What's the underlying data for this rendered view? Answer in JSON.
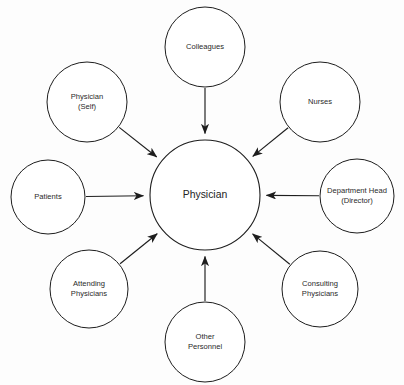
{
  "diagram": {
    "type": "hub-and-spoke",
    "background_color": "#fdfdfd",
    "line_color": "#1d1d1d",
    "text_color": "#2a2a2a",
    "center": {
      "id": "physician",
      "label": "Physician",
      "cx": 205,
      "cy": 195,
      "r": 55
    },
    "nodes": [
      {
        "id": "colleagues",
        "lines": [
          "Colleagues"
        ],
        "cx": 205,
        "cy": 47,
        "r": 40,
        "arrow_direction": "inward"
      },
      {
        "id": "physician-self",
        "lines": [
          "Physician",
          "(Self)"
        ],
        "cx": 87,
        "cy": 102,
        "r": 40,
        "arrow_direction": "inward"
      },
      {
        "id": "nurses",
        "lines": [
          "Nurses"
        ],
        "cx": 320,
        "cy": 102,
        "r": 40,
        "arrow_direction": "inward"
      },
      {
        "id": "department-head",
        "lines": [
          "Department Head",
          "(Director)"
        ],
        "cx": 357,
        "cy": 196,
        "r": 37,
        "arrow_direction": "inward"
      },
      {
        "id": "patients",
        "lines": [
          "Patients"
        ],
        "cx": 48,
        "cy": 197,
        "r": 37,
        "arrow_direction": "inward"
      },
      {
        "id": "attending-physicians",
        "lines": [
          "Attending",
          "Physicians"
        ],
        "cx": 89,
        "cy": 289,
        "r": 39,
        "arrow_direction": "inward"
      },
      {
        "id": "other-personnel",
        "lines": [
          "Other",
          "Personnel"
        ],
        "cx": 205,
        "cy": 342,
        "r": 40,
        "arrow_direction": "inward"
      },
      {
        "id": "consulting-physicians",
        "lines": [
          "Consulting",
          "Physicians"
        ],
        "cx": 320,
        "cy": 289,
        "r": 38,
        "arrow_direction": "inward"
      }
    ],
    "edges": [
      {
        "from": "colleagues",
        "to": "physician",
        "arrowhead": "at-target"
      },
      {
        "from": "physician-self",
        "to": "physician",
        "arrowhead": "at-target"
      },
      {
        "from": "nurses",
        "to": "physician",
        "arrowhead": "at-target"
      },
      {
        "from": "department-head",
        "to": "physician",
        "arrowhead": "at-target"
      },
      {
        "from": "patients",
        "to": "physician",
        "arrowhead": "at-target"
      },
      {
        "from": "attending-physicians",
        "to": "physician",
        "arrowhead": "at-target"
      },
      {
        "from": "other-personnel",
        "to": "physician",
        "arrowhead": "at-target"
      },
      {
        "from": "consulting-physicians",
        "to": "physician",
        "arrowhead": "at-target"
      }
    ]
  }
}
